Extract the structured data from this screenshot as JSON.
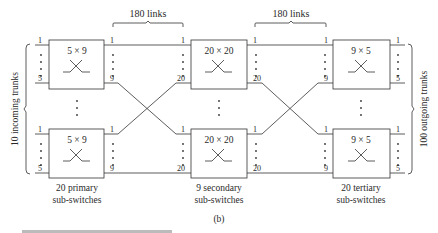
{
  "diagram": {
    "figure_label": "(b)",
    "links_labels": [
      "180 links",
      "180 links"
    ],
    "left_label": "10 incoming trunks",
    "right_label": "100 outgoing trunks",
    "stages": [
      {
        "name": "primary",
        "size": "5 × 9",
        "in_first": "1",
        "in_last": "5",
        "out_first": "1",
        "out_last": "9",
        "caption_line1": "20 primary",
        "caption_line2": "sub-switches"
      },
      {
        "name": "secondary",
        "size": "20 × 20",
        "in_first": "1",
        "in_last": "20",
        "out_first": "1",
        "out_last": "20",
        "caption_line1": "9 secondary",
        "caption_line2": "sub-switches"
      },
      {
        "name": "tertiary",
        "size": "9 × 5",
        "in_first": "1",
        "in_last": "9",
        "out_first": "1",
        "out_last": "5",
        "caption_line1": "20 tertiary",
        "caption_line2": "sub-switches"
      }
    ],
    "caption_partial": "20.40  Three-stage switch ..."
  }
}
